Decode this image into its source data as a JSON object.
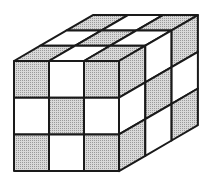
{
  "diagram": {
    "title": "",
    "colors": {
      "background": "#ffffff",
      "shaded": "#c8c8c8",
      "unshaded": "#ffffff",
      "edge": "#1a1a1a"
    },
    "geometry": {
      "front_origin": [
        14,
        61
      ],
      "cell_w": 35,
      "cell_h": 36.7,
      "depth_dx": 26.3,
      "depth_dy": -15.3,
      "grid": 3
    },
    "faces": {
      "front": [
        [
          "shaded",
          "unshaded",
          "shaded"
        ],
        [
          "unshaded",
          "shaded",
          "unshaded"
        ],
        [
          "shaded",
          "unshaded",
          "shaded"
        ]
      ],
      "top": [
        [
          "shaded",
          "unshaded",
          "shaded"
        ],
        [
          "unshaded",
          "shaded",
          "unshaded"
        ],
        [
          "shaded",
          "unshaded",
          "shaded"
        ]
      ],
      "right": [
        [
          "shaded",
          "unshaded",
          "shaded"
        ],
        [
          "unshaded",
          "shaded",
          "unshaded"
        ],
        [
          "shaded",
          "unshaded",
          "shaded"
        ]
      ]
    }
  }
}
